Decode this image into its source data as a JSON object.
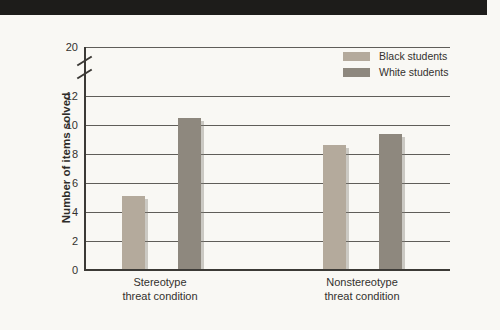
{
  "page": {
    "banner_color": "#1d1c1a",
    "background_color": "#f9f8f4"
  },
  "chart_data": {
    "type": "bar",
    "title": "",
    "ylabel": "Number of items solved",
    "xlabel": "",
    "y_ticks": [
      0,
      2,
      4,
      6,
      8,
      10,
      12,
      20
    ],
    "y_axis_break": {
      "between": [
        12,
        20
      ]
    },
    "ylim_displayed": [
      0,
      13
    ],
    "grid": true,
    "legend_position": "top-right",
    "categories": [
      {
        "line1": "Stereotype",
        "line2": "threat condition"
      },
      {
        "line1": "Nonstereotype",
        "line2": "threat condition"
      }
    ],
    "series": [
      {
        "name": "Black students",
        "color": "#b4aa9c",
        "values": [
          5.1,
          8.6
        ]
      },
      {
        "name": "White students",
        "color": "#8e887e",
        "values": [
          10.5,
          9.4
        ]
      }
    ],
    "gridline_color": "#605e59",
    "axis_color": "#3c3a36"
  }
}
